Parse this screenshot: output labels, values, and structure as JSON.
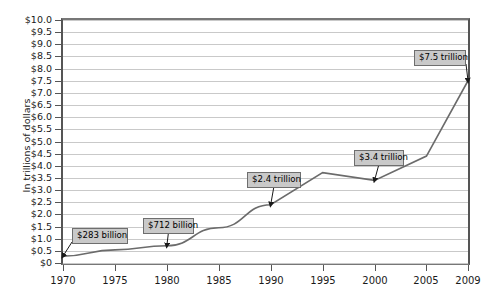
{
  "chart_data": {
    "type": "line",
    "title": "",
    "xlabel": "",
    "ylabel": "In trillions of dollars",
    "xlim": [
      1970,
      2009
    ],
    "ylim": [
      0,
      10
    ],
    "grid": true,
    "legend": null,
    "ytick_labels": [
      "$0",
      "$0.5",
      "$1.0",
      "$1.5",
      "$2.0",
      "$2.5",
      "$3.0",
      "$3.5",
      "$4.0",
      "$4.5",
      "$5.0",
      "$5.5",
      "$6.0",
      "$6.5",
      "$7.0",
      "$7.5",
      "$8.0",
      "$8.5",
      "$9.0",
      "$9.5",
      "$10.0"
    ],
    "ytick_values": [
      0,
      0.5,
      1,
      1.5,
      2,
      2.5,
      3,
      3.5,
      4,
      4.5,
      5,
      5.5,
      6,
      6.5,
      7,
      7.5,
      8,
      8.5,
      9,
      9.5,
      10
    ],
    "xtick_labels": [
      "1970",
      "1975",
      "1980",
      "1985",
      "1990",
      "1995",
      "2000",
      "2005",
      "2009"
    ],
    "xtick_values": [
      1970,
      1975,
      1980,
      1985,
      1990,
      1995,
      2000,
      2005,
      2009
    ],
    "series": [
      {
        "name": "Total debt",
        "color": "#6b6b6b",
        "x": [
          1970,
          1975,
          1980,
          1985,
          1990,
          1995,
          2000,
          2005,
          2009
        ],
        "values": [
          0.283,
          0.54,
          0.712,
          1.45,
          2.4,
          3.72,
          3.4,
          4.4,
          7.5
        ]
      }
    ],
    "annotations": [
      {
        "label": "$283 billion",
        "x": 1970,
        "y": 0.283
      },
      {
        "label": "$712 billion",
        "x": 1980,
        "y": 0.712
      },
      {
        "label": "$2.4 trillion",
        "x": 1990,
        "y": 2.4
      },
      {
        "label": "$3.4 trillion",
        "x": 2000,
        "y": 3.4
      },
      {
        "label": "$7.5 trillion",
        "x": 2009,
        "y": 7.5
      }
    ]
  },
  "colors": {
    "line": "#6b6b6b",
    "grid": "#c9c9c9",
    "axis": "#555555",
    "callout_fill": "#c9c9c9",
    "callout_border": "#6e6e6e",
    "background": "#ffffff"
  }
}
